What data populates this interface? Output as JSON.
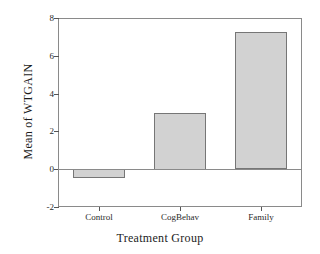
{
  "chart_data": {
    "type": "bar",
    "title": "",
    "subtitle": "",
    "xlabel": "Treatment Group",
    "ylabel": "Mean of  WTGAIN",
    "categories": [
      "Control",
      "CogBehav",
      "Family"
    ],
    "values": [
      -0.45,
      3.0,
      7.26
    ],
    "series": [
      {
        "name": "Mean of WTGAIN",
        "values": [
          -0.45,
          3.0,
          7.26
        ]
      }
    ],
    "ylim": [
      -2,
      8
    ],
    "yticks": [
      8,
      6,
      4,
      2,
      0,
      -2
    ],
    "ytick_labels": [
      "8",
      "6",
      "4",
      "2",
      "0",
      "-2"
    ],
    "grid": false,
    "legend": false,
    "legend_position": "none",
    "zero_line": 0,
    "bar_fill_color": "#d2d2d2",
    "bar_border_color": "#767676",
    "axis_color": "#8a8a8a",
    "text_color": "#1c1c1c",
    "background_color": "#ffffff"
  }
}
